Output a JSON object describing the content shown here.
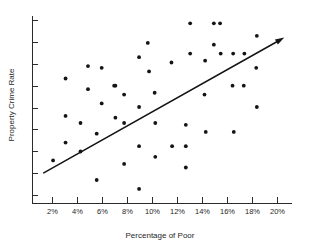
{
  "chart_data": {
    "type": "scatter",
    "title": "",
    "xlabel": "Percentage of Poor",
    "ylabel": "Property Crime Rate",
    "xlim": [
      1.0,
      20.9
    ],
    "ylim": [
      0,
      100
    ],
    "grid": false,
    "legend": null,
    "xticklabels": [
      "2%",
      "4%",
      "6%",
      "8%",
      "10%",
      "12%",
      "14%",
      "16%",
      "18%",
      "20%"
    ],
    "xtickvalues": [
      2,
      4,
      6,
      8,
      10,
      12,
      14,
      16,
      18,
      20
    ],
    "ytickcount": 9,
    "yticklabels": [],
    "points": [
      [
        3.05,
        66
      ],
      [
        3.05,
        45
      ],
      [
        3.05,
        30
      ],
      [
        2.05,
        20
      ],
      [
        4.25,
        41
      ],
      [
        4.25,
        25
      ],
      [
        4.85,
        60
      ],
      [
        4.85,
        73
      ],
      [
        5.55,
        35
      ],
      [
        5.55,
        9
      ],
      [
        5.95,
        52
      ],
      [
        5.95,
        72
      ],
      [
        7.05,
        62
      ],
      [
        7.05,
        44
      ],
      [
        7.75,
        57
      ],
      [
        7.75,
        41
      ],
      [
        7.75,
        18
      ],
      [
        8.95,
        78
      ],
      [
        8.95,
        50
      ],
      [
        8.95,
        28
      ],
      [
        8.95,
        4
      ],
      [
        9.65,
        86
      ],
      [
        9.75,
        70
      ],
      [
        10.2,
        58
      ],
      [
        10.25,
        41
      ],
      [
        10.25,
        22
      ],
      [
        11.55,
        75
      ],
      [
        11.6,
        28
      ],
      [
        12.7,
        40
      ],
      [
        12.7,
        28
      ],
      [
        12.7,
        16
      ],
      [
        13.05,
        97
      ],
      [
        13.05,
        80
      ],
      [
        14.2,
        57
      ],
      [
        14.25,
        76
      ],
      [
        14.3,
        36
      ],
      [
        14.95,
        97
      ],
      [
        14.95,
        85
      ],
      [
        15.45,
        97
      ],
      [
        15.5,
        80
      ],
      [
        16.45,
        62
      ],
      [
        16.5,
        80
      ],
      [
        16.55,
        36
      ],
      [
        17.35,
        62
      ],
      [
        17.4,
        80
      ],
      [
        18.35,
        72
      ],
      [
        18.4,
        90
      ],
      [
        18.4,
        50
      ],
      [
        6.95,
        62
      ]
    ],
    "trend": {
      "x_start": 1.3,
      "y_start": 13,
      "x_end": 20.6,
      "y_end": 89,
      "arrow": true
    },
    "point_color": "#141414",
    "line_color": "#141414",
    "axis_color": "#2b2b2b"
  }
}
